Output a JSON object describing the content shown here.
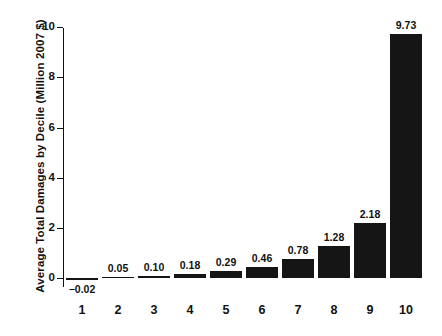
{
  "chart_data": {
    "type": "bar",
    "title": "",
    "xlabel": "",
    "ylabel": "Average Total Damages by Decile (Million 2007 $)",
    "categories": [
      "1",
      "2",
      "3",
      "4",
      "5",
      "6",
      "7",
      "8",
      "9",
      "10"
    ],
    "values": [
      -0.02,
      0.05,
      0.1,
      0.18,
      0.29,
      0.46,
      0.78,
      1.28,
      2.18,
      9.73
    ],
    "value_labels": [
      "−0.02",
      "0.05",
      "0.10",
      "0.18",
      "0.29",
      "0.46",
      "0.78",
      "1.28",
      "2.18",
      "9.73"
    ],
    "ylim": [
      -0.35,
      10.6
    ],
    "yticks": [
      0,
      2,
      4,
      6,
      8,
      10
    ],
    "ytick_labels": [
      "0",
      "2",
      "4",
      "6",
      "8",
      "10"
    ],
    "grid": false,
    "legend": null,
    "bar_color": "#151515",
    "axis_color": "#111111",
    "background_color": "#ffffff"
  }
}
